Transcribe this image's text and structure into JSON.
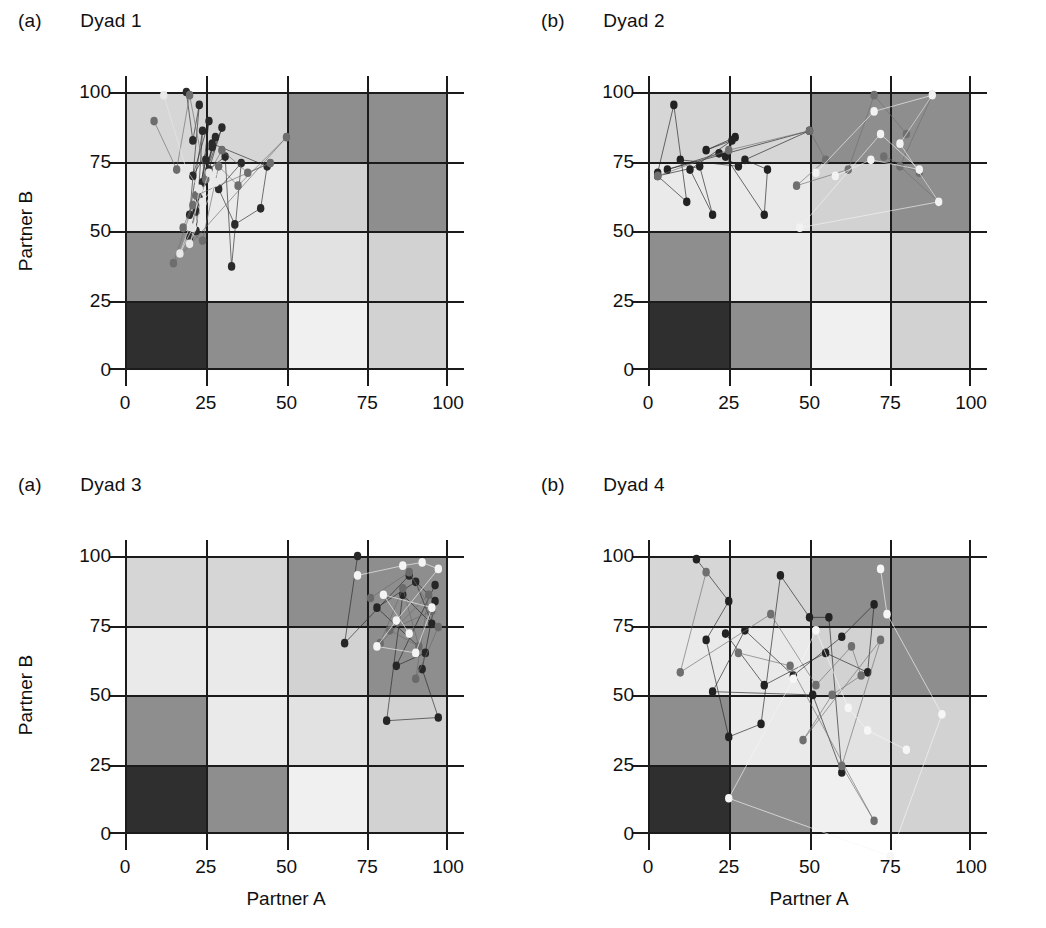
{
  "figure": {
    "axis_labels": {
      "x": "Partner A",
      "y": "Partner B"
    },
    "xticks": [
      "0",
      "25",
      "50",
      "75",
      "100"
    ],
    "yticks": [
      "0",
      "25",
      "50",
      "75",
      "100"
    ],
    "panels": [
      {
        "tag": "(a)",
        "title": "Dyad 1"
      },
      {
        "tag": "(b)",
        "title": "Dyad 2"
      },
      {
        "tag": "(a)",
        "title": "Dyad 3"
      },
      {
        "tag": "(b)",
        "title": "Dyad 4"
      }
    ]
  },
  "colors": {
    "axis": "#1b1b1b",
    "text": "#101010",
    "background": "#ffffff",
    "grid_shades": [
      "#2b2b2b",
      "#6e6e6e",
      "#9a9a9a",
      "#bdbdbd",
      "#d6d6d6",
      "#eaeaea",
      "#f4f4f4"
    ]
  },
  "grid_background": {
    "description": "4x4 checkerboard of grayscale cells, rows listed top (75-100) to bottom (0-25), columns left (0-25) to right (75-100)",
    "rows": [
      [
        "#d6d6d6",
        "#d6d6d6",
        "#8e8e8e",
        "#8e8e8e"
      ],
      [
        "#eaeaea",
        "#eaeaea",
        "#d2d2d2",
        "#8e8e8e"
      ],
      [
        "#8e8e8e",
        "#eaeaea",
        "#e2e2e2",
        "#d2d2d2"
      ],
      [
        "#2f2f2f",
        "#8e8e8e",
        "#f0f0f0",
        "#d2d2d2"
      ]
    ]
  },
  "chart_data": [
    {
      "type": "scatter",
      "title": "Dyad 1",
      "panel_tag": "(a)",
      "xlabel": "Partner A",
      "ylabel": "Partner B",
      "xlim": [
        0,
        100
      ],
      "ylim": [
        0,
        100
      ],
      "xticks": [
        0,
        25,
        50,
        75,
        100
      ],
      "yticks": [
        0,
        25,
        50,
        75,
        100
      ],
      "grid": true,
      "legend": "none",
      "series": [
        {
          "name": "trajectory-dark",
          "color": "#2a2a2a",
          "points": [
            [
              19,
              100
            ],
            [
              21,
              85
            ],
            [
              23,
              96
            ],
            [
              20,
              62
            ],
            [
              24,
              88
            ],
            [
              22,
              57
            ],
            [
              26,
              91
            ],
            [
              21,
              74
            ],
            [
              28,
              86
            ],
            [
              23,
              67
            ],
            [
              25,
              79
            ],
            [
              20,
              55
            ],
            [
              27,
              83
            ],
            [
              24,
              72
            ],
            [
              30,
              89
            ],
            [
              22,
              63
            ],
            [
              26,
              76
            ],
            [
              31,
              80
            ],
            [
              33,
              46
            ],
            [
              36,
              78
            ],
            [
              29,
              70
            ],
            [
              34,
              59
            ],
            [
              42,
              64
            ],
            [
              44,
              77
            ],
            [
              27,
              84
            ]
          ]
        },
        {
          "name": "trajectory-mid",
          "color": "#6d6d6d",
          "points": [
            [
              9,
              91
            ],
            [
              16,
              76
            ],
            [
              20,
              99
            ],
            [
              25,
              73
            ],
            [
              30,
              82
            ],
            [
              38,
              75
            ],
            [
              45,
              78
            ],
            [
              22,
              68
            ],
            [
              18,
              58
            ],
            [
              24,
              54
            ],
            [
              29,
              77
            ],
            [
              35,
              71
            ],
            [
              50,
              86
            ],
            [
              15,
              47
            ],
            [
              21,
              65
            ]
          ]
        },
        {
          "name": "trajectory-light",
          "color": "#e8e8e8",
          "points": [
            [
              12,
              99
            ],
            [
              19,
              76
            ],
            [
              23,
              70
            ],
            [
              21,
              58
            ],
            [
              17,
              50
            ],
            [
              26,
              75
            ],
            [
              30,
              74
            ],
            [
              24,
              66
            ],
            [
              20,
              53
            ],
            [
              28,
              72
            ]
          ]
        }
      ]
    },
    {
      "type": "scatter",
      "title": "Dyad 2",
      "panel_tag": "(b)",
      "xlabel": "Partner A",
      "ylabel": "Partner B",
      "xlim": [
        0,
        100
      ],
      "ylim": [
        0,
        100
      ],
      "xticks": [
        0,
        25,
        50,
        75,
        100
      ],
      "yticks": [
        0,
        25,
        50,
        75,
        100
      ],
      "grid": true,
      "legend": "none",
      "series": [
        {
          "name": "trajectory-dark",
          "color": "#222222",
          "points": [
            [
              3,
              75
            ],
            [
              8,
              96
            ],
            [
              12,
              66
            ],
            [
              3,
              74
            ],
            [
              16,
              77
            ],
            [
              20,
              62
            ],
            [
              13,
              76
            ],
            [
              26,
              85
            ],
            [
              18,
              82
            ],
            [
              27,
              86
            ],
            [
              24,
              80
            ],
            [
              36,
              62
            ],
            [
              37,
              76
            ],
            [
              30,
              79
            ],
            [
              50,
              88
            ],
            [
              6,
              76
            ],
            [
              22,
              81
            ],
            [
              28,
              77
            ],
            [
              10,
              79
            ]
          ]
        },
        {
          "name": "trajectory-mid",
          "color": "#6f6f6f",
          "points": [
            [
              3,
              74
            ],
            [
              25,
              82
            ],
            [
              50,
              88
            ],
            [
              55,
              79
            ],
            [
              46,
              71
            ],
            [
              62,
              76
            ],
            [
              70,
              99
            ],
            [
              80,
              87
            ],
            [
              88,
              99
            ],
            [
              78,
              77
            ],
            [
              90,
              66
            ],
            [
              84,
              75
            ],
            [
              73,
              80
            ]
          ]
        },
        {
          "name": "trajectory-light",
          "color": "#f2f2f2",
          "points": [
            [
              52,
              75
            ],
            [
              70,
              94
            ],
            [
              88,
              99
            ],
            [
              78,
              84
            ],
            [
              90,
              66
            ],
            [
              47,
              58
            ],
            [
              72,
              87
            ],
            [
              84,
              76
            ],
            [
              69,
              79
            ],
            [
              58,
              74
            ]
          ]
        }
      ]
    },
    {
      "type": "scatter",
      "title": "Dyad 3",
      "panel_tag": "(a)",
      "xlabel": "Partner A",
      "ylabel": "Partner B",
      "xlim": [
        0,
        100
      ],
      "ylim": [
        0,
        100
      ],
      "xticks": [
        0,
        25,
        50,
        75,
        100
      ],
      "yticks": [
        0,
        25,
        50,
        75,
        100
      ],
      "grid": true,
      "legend": "none",
      "series": [
        {
          "name": "trajectory-dark",
          "color": "#262626",
          "points": [
            [
              72,
              100
            ],
            [
              68,
              73
            ],
            [
              88,
              94
            ],
            [
              96,
              86
            ],
            [
              92,
              65
            ],
            [
              97,
              50
            ],
            [
              81,
              49
            ],
            [
              86,
              88
            ],
            [
              95,
              79
            ],
            [
              90,
              92
            ],
            [
              78,
              84
            ],
            [
              93,
              70
            ],
            [
              84,
              66
            ],
            [
              96,
              91
            ]
          ]
        },
        {
          "name": "trajectory-mid",
          "color": "#6a6a6a",
          "points": [
            [
              76,
              87
            ],
            [
              88,
              95
            ],
            [
              95,
              83
            ],
            [
              82,
              77
            ],
            [
              91,
              72
            ],
            [
              86,
              90
            ],
            [
              79,
              73
            ],
            [
              94,
              88
            ],
            [
              90,
              62
            ],
            [
              97,
              78
            ]
          ]
        },
        {
          "name": "trajectory-light",
          "color": "#f4f4f4",
          "points": [
            [
              72,
              94
            ],
            [
              86,
              97
            ],
            [
              92,
              98
            ],
            [
              97,
              96
            ],
            [
              84,
              80
            ],
            [
              78,
              72
            ],
            [
              90,
              70
            ],
            [
              95,
              84
            ],
            [
              80,
              88
            ],
            [
              88,
              76
            ]
          ]
        }
      ]
    },
    {
      "type": "scatter",
      "title": "Dyad 4",
      "panel_tag": "(b)",
      "xlabel": "Partner A",
      "ylabel": "Partner B",
      "xlim": [
        0,
        100
      ],
      "ylim": [
        0,
        100
      ],
      "xticks": [
        0,
        25,
        50,
        75,
        100
      ],
      "yticks": [
        0,
        25,
        50,
        75,
        100
      ],
      "grid": true,
      "legend": "none",
      "series": [
        {
          "name": "trajectory-dark",
          "color": "#222222",
          "points": [
            [
              15,
              99
            ],
            [
              25,
              86
            ],
            [
              18,
              74
            ],
            [
              25,
              44
            ],
            [
              35,
              48
            ],
            [
              41,
              94
            ],
            [
              50,
              81
            ],
            [
              56,
              81
            ],
            [
              60,
              33
            ],
            [
              51,
              57
            ],
            [
              20,
              58
            ],
            [
              30,
              77
            ],
            [
              45,
              63
            ],
            [
              60,
              75
            ],
            [
              70,
              85
            ],
            [
              68,
              64
            ],
            [
              55,
              70
            ],
            [
              36,
              60
            ],
            [
              24,
              76
            ]
          ]
        },
        {
          "name": "trajectory-mid",
          "color": "#6f6f6f",
          "points": [
            [
              18,
              95
            ],
            [
              10,
              64
            ],
            [
              38,
              82
            ],
            [
              52,
              60
            ],
            [
              63,
              72
            ],
            [
              66,
              63
            ],
            [
              57,
              57
            ],
            [
              48,
              43
            ],
            [
              72,
              74
            ],
            [
              60,
              35
            ],
            [
              70,
              18
            ],
            [
              44,
              66
            ],
            [
              28,
              70
            ]
          ]
        },
        {
          "name": "trajectory-light",
          "color": "#f6f6f6",
          "points": [
            [
              72,
              96
            ],
            [
              74,
              82
            ],
            [
              91,
              51
            ],
            [
              75,
              7
            ],
            [
              25,
              25
            ],
            [
              45,
              62
            ],
            [
              52,
              77
            ],
            [
              62,
              53
            ],
            [
              68,
              46
            ],
            [
              80,
              40
            ]
          ]
        }
      ]
    }
  ]
}
